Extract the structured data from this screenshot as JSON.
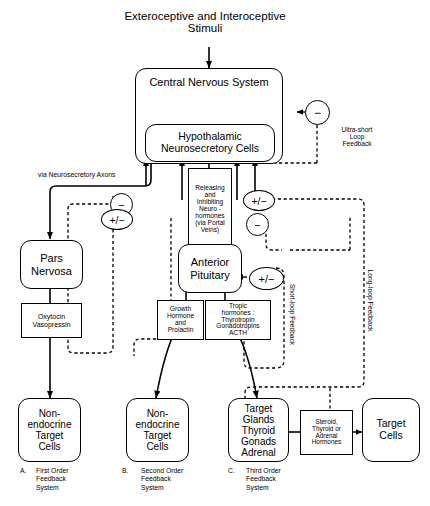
{
  "diagram": {
    "title_top": "Exteroceptive and Interoceptive\nStimuli",
    "boxes": {
      "cns": "Central Nervous System",
      "hypothalamic": "Hypothalamic\nNeurosecretory Cells",
      "pars_nervosa": "Pars\nNervosa",
      "anterior_pituitary": "Anterior\nPituitary",
      "releasing_inhibiting": "Releasing\nand\nInhibiting\nNeuro -\nhormones\n(via Portal\nVeins)",
      "oxytocin_vasopressin": "Oxytocin\nVasopressin",
      "growth_hormone": "Growth\nHormone\nand\nProlactin",
      "tropic_hormones": "Tropic\nhormones :\nThyrotropin\nGonadotropins\nACTH",
      "nonendocrine_a": "Non-\nendocrine\nTarget\nCells",
      "nonendocrine_b": "Non-\nendocrine\nTarget\nCells",
      "target_glands": "Target\nGlands\nThyroid\nGonads\nAdrenal",
      "steroid_hormones": "Steroid,\nThyroid or\nAdrenal\nHormones",
      "target_cells": "Target\nCells"
    },
    "labels": {
      "via_axons": "via Neurosecretory Axons",
      "ultra_short": "Ultra-short\nLoop\nFeedback",
      "short_loop": "Short-loop Feedback",
      "long_loop": "Long-loop Feedback"
    },
    "signs": {
      "minus": "−",
      "plus_minus": "+/−"
    },
    "captions": [
      {
        "letter": "A.",
        "text": "First Order\nFeedback\nSystem"
      },
      {
        "letter": "B.",
        "text": "Second Order\nFeedback\nSystem"
      },
      {
        "letter": "C.",
        "text": "Third Order\nFeedback\nSystem"
      }
    ],
    "colors": {
      "ink": "#000000",
      "paper": "#ffffff"
    }
  }
}
